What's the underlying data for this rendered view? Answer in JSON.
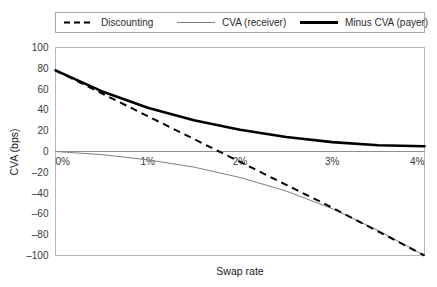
{
  "chart_data": {
    "type": "line",
    "title": "",
    "xlabel": "Swap rate",
    "ylabel": "CVA (bps)",
    "x": [
      0,
      0.5,
      1,
      1.5,
      2,
      2.5,
      3,
      3.5,
      4
    ],
    "x_tick_labels": [
      "0%",
      "1%",
      "2%",
      "3%",
      "4%"
    ],
    "x_tick_values": [
      0,
      1,
      2,
      3,
      4
    ],
    "xlim": [
      0,
      4
    ],
    "ylim": [
      -100,
      100
    ],
    "y_tick_labels": [
      "100",
      "80",
      "60",
      "40",
      "20",
      "0",
      "-20",
      "-40",
      "-60",
      "-80",
      "-100"
    ],
    "y_tick_values": [
      100,
      80,
      60,
      40,
      20,
      0,
      -20,
      -40,
      -60,
      -80,
      -100
    ],
    "grid": false,
    "legend_position": "top",
    "series": [
      {
        "name": "Discounting",
        "style": "dashed",
        "color": "#000000",
        "width": 2,
        "values": [
          78,
          56,
          34,
          12,
          -10,
          -32,
          -54,
          -77,
          -100
        ]
      },
      {
        "name": "CVA (receiver)",
        "style": "solid-thin",
        "color": "#808080",
        "width": 1,
        "values": [
          0,
          -3,
          -8,
          -15,
          -25,
          -38,
          -55,
          -76,
          -100
        ]
      },
      {
        "name": "Minus CVA (payer)",
        "style": "solid-thick",
        "color": "#000000",
        "width": 2.6,
        "values": [
          78,
          58,
          42,
          30,
          21,
          14,
          9,
          6,
          5
        ]
      }
    ]
  },
  "legend": {
    "items": [
      {
        "label": "Discounting"
      },
      {
        "label": "CVA (receiver)"
      },
      {
        "label": "Minus CVA (payer)"
      }
    ]
  },
  "axes": {
    "x_title": "Swap rate",
    "y_title": "CVA (bps)"
  },
  "colors": {
    "plot_border": "#b0b0b0",
    "zero_axis": "#909090",
    "legend_border": "#a8a8a8",
    "background": "#ffffff",
    "dark_line": "#000000",
    "gray_line": "#808080"
  }
}
